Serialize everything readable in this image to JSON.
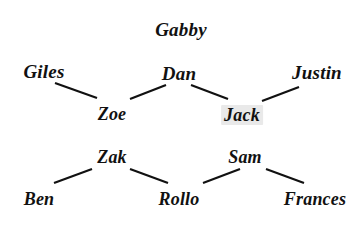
{
  "diagram": {
    "background_color": "#ffffff",
    "text_color": "#111111",
    "edge_color": "#111111",
    "highlight_color": "#e9e9e9",
    "nodes": [
      {
        "id": "gabby",
        "label": "Gabby",
        "x": 181,
        "y": 29,
        "size": 19,
        "highlight": false
      },
      {
        "id": "giles",
        "label": "Giles",
        "x": 44,
        "y": 71,
        "size": 19,
        "highlight": false
      },
      {
        "id": "dan",
        "label": "Dan",
        "x": 179,
        "y": 73,
        "size": 19,
        "highlight": false
      },
      {
        "id": "justin",
        "label": "Justin",
        "x": 317,
        "y": 72,
        "size": 19,
        "highlight": false
      },
      {
        "id": "zoe",
        "label": "Zoe",
        "x": 112,
        "y": 114,
        "size": 18,
        "highlight": false
      },
      {
        "id": "jack",
        "label": "Jack",
        "x": 242,
        "y": 115,
        "size": 18,
        "highlight": true
      },
      {
        "id": "zak",
        "label": "Zak",
        "x": 112,
        "y": 157,
        "size": 18,
        "highlight": false
      },
      {
        "id": "sam",
        "label": "Sam",
        "x": 245,
        "y": 157,
        "size": 18,
        "highlight": false
      },
      {
        "id": "ben",
        "label": "Ben",
        "x": 39,
        "y": 199,
        "size": 18,
        "highlight": false
      },
      {
        "id": "rollo",
        "label": "Rollo",
        "x": 179,
        "y": 199,
        "size": 18,
        "highlight": false
      },
      {
        "id": "frances",
        "label": "Frances",
        "x": 315,
        "y": 199,
        "size": 18,
        "highlight": false
      }
    ],
    "edges": [
      {
        "id": "giles-zoe",
        "from": "giles",
        "to": "zoe",
        "x1": 55,
        "y1": 83,
        "x2": 97,
        "y2": 98
      },
      {
        "id": "zoe-dan",
        "from": "zoe",
        "to": "dan",
        "x1": 130,
        "y1": 99,
        "x2": 166,
        "y2": 85
      },
      {
        "id": "dan-jack",
        "from": "dan",
        "to": "jack",
        "x1": 191,
        "y1": 85,
        "x2": 228,
        "y2": 99
      },
      {
        "id": "jack-justin",
        "from": "jack",
        "to": "justin",
        "x1": 262,
        "y1": 101,
        "x2": 299,
        "y2": 87
      },
      {
        "id": "ben-zak",
        "from": "ben",
        "to": "zak",
        "x1": 54,
        "y1": 183,
        "x2": 92,
        "y2": 169
      },
      {
        "id": "zak-rollo",
        "from": "zak",
        "to": "rollo",
        "x1": 130,
        "y1": 169,
        "x2": 168,
        "y2": 183
      },
      {
        "id": "rollo-sam",
        "from": "rollo",
        "to": "sam",
        "x1": 203,
        "y1": 183,
        "x2": 240,
        "y2": 169
      },
      {
        "id": "sam-frances",
        "from": "sam",
        "to": "frances",
        "x1": 266,
        "y1": 169,
        "x2": 304,
        "y2": 183
      }
    ]
  }
}
